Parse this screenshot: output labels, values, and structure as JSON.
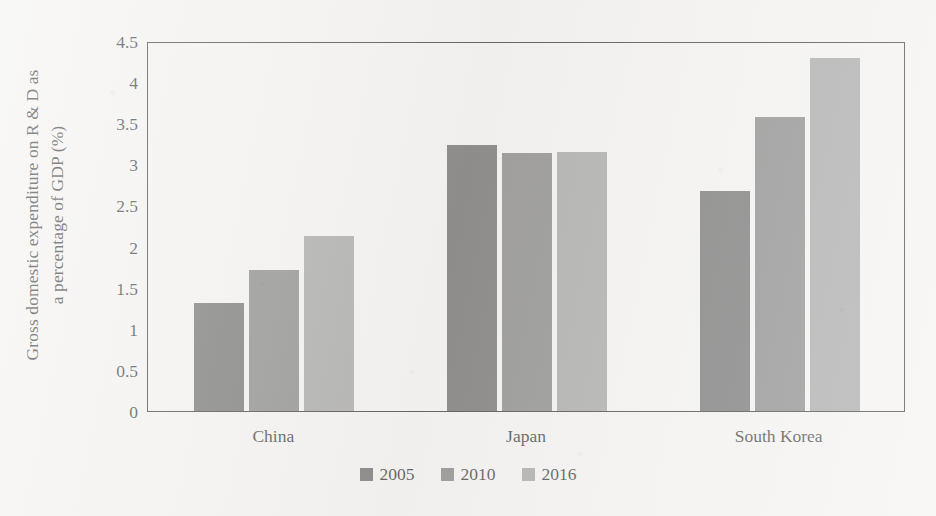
{
  "chart_data": {
    "type": "bar",
    "title": "",
    "xlabel": "",
    "ylabel": "Gross domestic expenditure on R & D as a percentage of GDP (%)",
    "ylabel_lines": [
      "Gross domestic expenditure on R & D as",
      "a percentage of GDP (%)"
    ],
    "categories": [
      "China",
      "Japan",
      "South Korea"
    ],
    "series": [
      {
        "name": "2005",
        "color": "#595959",
        "values": [
          1.31,
          3.24,
          2.67
        ]
      },
      {
        "name": "2010",
        "color": "#737373",
        "values": [
          1.72,
          3.14,
          3.57
        ]
      },
      {
        "name": "2016",
        "color": "#969696",
        "values": [
          2.13,
          3.15,
          4.29
        ]
      }
    ],
    "ylim": [
      0,
      4.5
    ],
    "yticks": [
      0,
      0.5,
      1,
      1.5,
      2,
      2.5,
      3,
      3.5,
      4,
      4.5
    ],
    "ytick_labels": [
      "0",
      "0.5",
      "1",
      "1.5",
      "2",
      "2.5",
      "3",
      "3.5",
      "4",
      "4.5"
    ],
    "grid": false,
    "legend_position": "bottom",
    "frame": true,
    "background_color": "#f2f1ef",
    "axis_color": "#1c1c1c"
  }
}
